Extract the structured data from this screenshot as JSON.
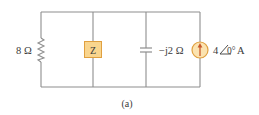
{
  "diagram": {
    "type": "circuit",
    "caption": "(a)",
    "colors": {
      "wire": "#8e8e8e",
      "component_fill": "#f9d58e",
      "component_stroke": "#e0a040",
      "source_fill": "#fbe3b0",
      "arrow": "#c8582a",
      "text": "#3a3a3a"
    },
    "components": {
      "resistor": {
        "label": "8 Ω",
        "kind": "resistor"
      },
      "impedance": {
        "label": "Z",
        "kind": "impedance-box"
      },
      "capacitor": {
        "label": "−j2 Ω",
        "kind": "capacitor"
      },
      "source": {
        "label_mag": "4",
        "label_angle": "0°",
        "label_unit": " A",
        "kind": "current-source",
        "direction": "up"
      }
    }
  }
}
